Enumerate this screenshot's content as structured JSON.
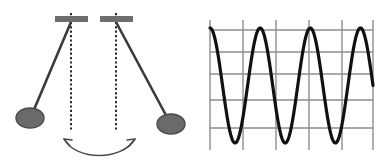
{
  "figure": {
    "width": 386,
    "height": 168,
    "background_color": "#ffffff"
  },
  "colors": {
    "pivot_bar": "#6e6e6e",
    "bob_fill": "#6a6a6a",
    "bob_stroke": "#4a4a4a",
    "rod": "#3a3a3a",
    "plumb_line": "#2b2b2b",
    "arrow": "#4a4a4a",
    "grid_line": "#8d8d8d",
    "wave_curve": "#111111"
  },
  "pendulum_panel": {
    "name": "pendulum-diagram",
    "pivots": [
      {
        "label": "left-pivot-bar",
        "x1": 55,
        "x2": 88,
        "y": 19,
        "thickness": 6
      },
      {
        "label": "right-pivot-bar",
        "x1": 100,
        "x2": 133,
        "y": 19,
        "thickness": 6
      }
    ],
    "plumb_lines": [
      {
        "label": "left-plumb-line",
        "x": 71,
        "y1": 13,
        "y2": 131
      },
      {
        "label": "right-plumb-line",
        "x": 116,
        "y1": 13,
        "y2": 131
      }
    ],
    "rods": [
      {
        "label": "left-rod",
        "x1": 71,
        "y1": 22,
        "x2": 33,
        "y2": 112
      },
      {
        "label": "right-rod",
        "x1": 116,
        "y1": 22,
        "x2": 168,
        "y2": 119
      }
    ],
    "bobs": [
      {
        "label": "left-bob",
        "cx": 30,
        "cy": 118,
        "rx": 14,
        "ry": 10
      },
      {
        "label": "right-bob",
        "cx": 171,
        "cy": 124,
        "rx": 14,
        "ry": 10
      }
    ],
    "swing_arrow": {
      "label": "swing-arrow",
      "description": "double-headed curved arrow indicating swing direction",
      "path": "M 64 139 C 76 161, 122 161, 135 139",
      "left_head": "M 64 139 L 70 146 M 64 139 L 72 140",
      "right_head": "M 135 139 L 129 146 M 135 139 L 127 140"
    }
  },
  "chart_data": {
    "type": "line",
    "title": "",
    "xlabel": "",
    "ylabel": "",
    "grid": true,
    "legend": null,
    "xlim": [
      0,
      3.25
    ],
    "ylim": [
      -1,
      1
    ],
    "plot_box": {
      "left": 210,
      "right": 373,
      "top": 20,
      "bottom": 150
    },
    "gridlines": {
      "horizontal_y": [
        30,
        52,
        74,
        100,
        128
      ],
      "vertical_x": [
        210,
        243,
        276,
        309,
        342,
        373
      ]
    },
    "series": [
      {
        "name": "cosine wave",
        "form": "y = cos(2*pi*x)",
        "amplitude": 1,
        "periods": 3,
        "color": "#111111",
        "line_width": 3.2,
        "x": [
          0,
          0.125,
          0.25,
          0.375,
          0.5,
          0.625,
          0.75,
          0.875,
          1,
          1.125,
          1.25,
          1.375,
          1.5,
          1.625,
          1.75,
          1.875,
          2,
          2.125,
          2.25,
          2.375,
          2.5,
          2.625,
          2.75,
          2.875,
          3,
          3.125,
          3.25
        ],
        "y": [
          1,
          0.707,
          0,
          -0.707,
          -1,
          -0.707,
          0,
          0.707,
          1,
          0.707,
          0,
          -0.707,
          -1,
          -0.707,
          0,
          0.707,
          1,
          0.707,
          0,
          -0.707,
          -1,
          -0.707,
          0,
          0.707,
          1,
          0.707,
          0
        ]
      }
    ],
    "peaks_x": [
      0,
      1,
      2,
      3
    ],
    "troughs_x": [
      0.5,
      1.5,
      2.5
    ]
  }
}
